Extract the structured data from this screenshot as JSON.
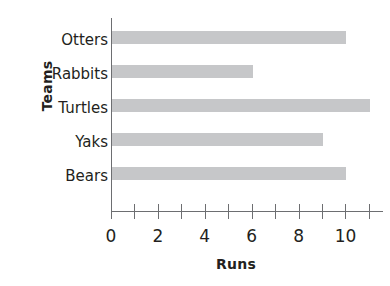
{
  "chart_data": {
    "type": "bar",
    "orientation": "horizontal",
    "title": "",
    "xlabel": "Runs",
    "ylabel": "Teams",
    "categories": [
      "Otters",
      "Rabbits",
      "Turtles",
      "Yaks",
      "Bears"
    ],
    "values": [
      10,
      6,
      11,
      9,
      10
    ],
    "series": [
      {
        "name": "Runs",
        "values": [
          10,
          6,
          11,
          9,
          10
        ]
      }
    ],
    "xlim": [
      0,
      11.6
    ],
    "x_ticks": [
      0,
      1,
      2,
      3,
      4,
      5,
      6,
      7,
      8,
      9,
      10,
      11
    ],
    "x_tick_labels": [
      "0",
      "2",
      "4",
      "6",
      "8",
      "10"
    ],
    "x_tick_label_values": [
      0,
      2,
      4,
      6,
      8,
      10
    ],
    "grid": false,
    "legend": false,
    "legend_position": "none",
    "bar_color": "#c6c7c9",
    "axis_color": "#6d6e71",
    "text_color": "#231f20",
    "background_color": "#ffffff"
  },
  "axes": {
    "y_title": "Teams",
    "x_title": "Runs"
  }
}
